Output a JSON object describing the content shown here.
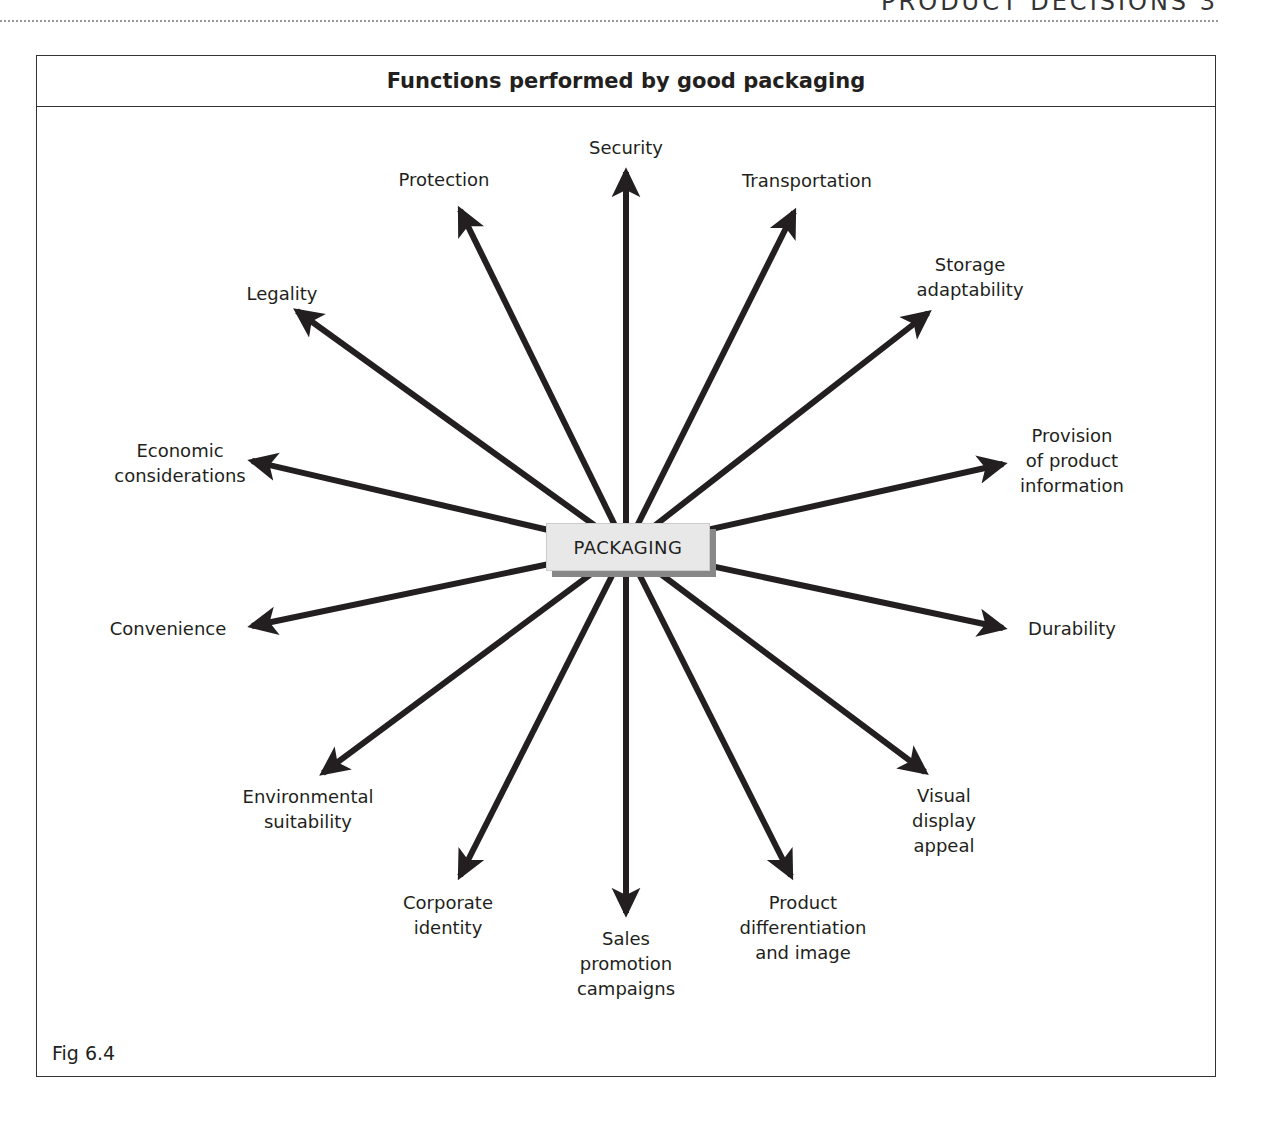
{
  "running_head": "PRODUCT DECISIONS 3",
  "figure": {
    "title": "Functions performed by good packaging",
    "center_label": "PACKAGING",
    "caption": "Fig 6.4"
  },
  "functions": [
    {
      "id": "security",
      "lines": [
        "Security"
      ]
    },
    {
      "id": "protection",
      "lines": [
        "Protection"
      ]
    },
    {
      "id": "transportation",
      "lines": [
        "Transportation"
      ]
    },
    {
      "id": "storage",
      "lines": [
        "Storage",
        "adaptability"
      ]
    },
    {
      "id": "legality",
      "lines": [
        "Legality"
      ]
    },
    {
      "id": "provision",
      "lines": [
        "Provision",
        "of product",
        "information"
      ]
    },
    {
      "id": "economic",
      "lines": [
        "Economic",
        "considerations"
      ]
    },
    {
      "id": "convenience",
      "lines": [
        "Convenience"
      ]
    },
    {
      "id": "durability",
      "lines": [
        "Durability"
      ]
    },
    {
      "id": "environmental",
      "lines": [
        "Environmental",
        "suitability"
      ]
    },
    {
      "id": "visual",
      "lines": [
        "Visual",
        "display",
        "appeal"
      ]
    },
    {
      "id": "corporate",
      "lines": [
        "Corporate",
        "identity"
      ]
    },
    {
      "id": "sales",
      "lines": [
        "Sales",
        "promotion",
        "campaigns"
      ]
    },
    {
      "id": "differentiation",
      "lines": [
        "Product",
        "differentiation",
        "and image"
      ]
    }
  ],
  "colors": {
    "arrow": "#231f20",
    "center_fill": "#e8e8e8",
    "center_shadow": "#888888",
    "frame": "#333333"
  }
}
